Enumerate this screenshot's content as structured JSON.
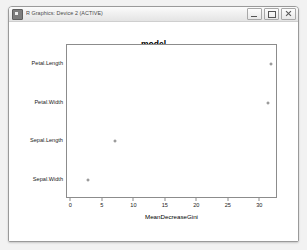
{
  "window": {
    "title": "R Graphics: Device 2 (ACTIVE)",
    "app_icon": "r-graphics-icon",
    "buttons": {
      "minimize": "Minimize",
      "maximize": "Maximize",
      "close": "Close"
    }
  },
  "chart_data": {
    "type": "scatter",
    "title": "model",
    "xlabel": "MeanDecreaseGini",
    "ylabel": "",
    "categories": [
      "Petal.Length",
      "Petal.Width",
      "Sepal.Length",
      "Sepal.Width"
    ],
    "values": [
      31.7,
      31.2,
      7.0,
      2.6
    ],
    "xlim": [
      -0.7,
      32.8
    ],
    "xticks": [
      0,
      5,
      10,
      15,
      20,
      25,
      30
    ],
    "xticklabels": [
      "0",
      "5",
      "10",
      "15",
      "20",
      "25",
      "30"
    ],
    "grid": false,
    "legend": null,
    "marker": "open-circle",
    "marker_color": "#7a7a7a"
  },
  "colors": {
    "window_border": "#9a9a9a",
    "titlebar": "#eeeeee",
    "canvas": "#ffffff",
    "axis": "#8c8c8c",
    "text": "#1a1a1a",
    "desktop": "#f2f2f2"
  }
}
